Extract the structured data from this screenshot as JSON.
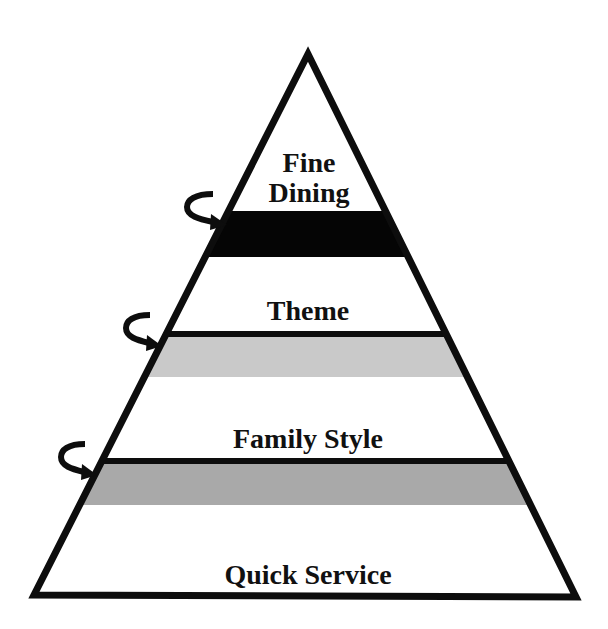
{
  "diagram": {
    "type": "pyramid",
    "colors": {
      "outline": "#0d0d0d",
      "band_fine_dining": "#050505",
      "band_theme": "#c9c9c9",
      "band_family_style": "#a9a9a9",
      "background": "#ffffff"
    },
    "tiers": [
      {
        "id": "fine-dining",
        "label_line1": "Fine",
        "label_line2": "Dining"
      },
      {
        "id": "theme",
        "label": "Theme"
      },
      {
        "id": "family-style",
        "label": "Family Style"
      },
      {
        "id": "quick-service",
        "label": "Quick Service"
      }
    ],
    "arrows": [
      {
        "name": "curved-arrow-icon",
        "position": "fine-dining-boundary"
      },
      {
        "name": "curved-arrow-icon",
        "position": "theme-boundary"
      },
      {
        "name": "curved-arrow-icon",
        "position": "family-style-boundary"
      }
    ]
  }
}
